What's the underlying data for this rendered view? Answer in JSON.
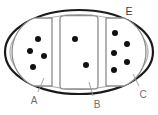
{
  "diagram": {
    "type": "labeled-cross-section",
    "title": "",
    "background_color": "#ffffff",
    "outline": {
      "shape": "ellipse",
      "outer_stroke_color": "#1a1a1a",
      "outer_stroke_width": 2.2,
      "inner_stroke_color": "#b0b0b0",
      "inner_stroke_width": 1.2,
      "center_x": 79,
      "center_y": 52,
      "radius_x": 74,
      "radius_y": 42
    },
    "compartments": [
      {
        "id": "left",
        "label": "A",
        "dot_count": 5,
        "dots": [
          {
            "cx": 38,
            "cy": 39,
            "r": 3.0
          },
          {
            "cx": 31,
            "cy": 51,
            "r": 3.0
          },
          {
            "cx": 45,
            "cy": 56,
            "r": 3.0
          },
          {
            "cx": 33,
            "cy": 66,
            "r": 3.0
          },
          {
            "cx": 24,
            "cy": 52,
            "r": 0
          }
        ],
        "fill": "#ffffff",
        "stroke": "#8c8c8c"
      },
      {
        "id": "middle",
        "label": "B",
        "dot_count": 2,
        "dots": [
          {
            "cx": 75,
            "cy": 39,
            "r": 3.0
          },
          {
            "cx": 86,
            "cy": 65,
            "r": 3.0
          }
        ],
        "fill": "#ffffff",
        "stroke": "#8c8c8c"
      },
      {
        "id": "right",
        "label": "C",
        "dot_count": 6,
        "dots": [
          {
            "cx": 115,
            "cy": 33,
            "r": 3.0
          },
          {
            "cx": 126,
            "cy": 43,
            "r": 3.0
          },
          {
            "cx": 114,
            "cy": 53,
            "r": 3.0
          },
          {
            "cx": 126,
            "cy": 61,
            "r": 3.0
          },
          {
            "cx": 114,
            "cy": 70,
            "r": 3.0
          },
          {
            "cx": 103,
            "cy": 52,
            "r": 0
          }
        ],
        "fill": "#ffffff",
        "stroke": "#8c8c8c"
      }
    ],
    "dot_color": "#111111",
    "labels": [
      {
        "id": "label-e",
        "text": "E",
        "x": 129,
        "y": 12,
        "position": "top-right",
        "target": "outer-membrane",
        "has_leader": false
      },
      {
        "id": "label-a",
        "text": "A",
        "x": 33,
        "y": 100,
        "position": "bottom-left",
        "target": "left-compartment",
        "has_leader": true,
        "leader": {
          "x1": 38,
          "y1": 91,
          "x2": 44,
          "y2": 78
        }
      },
      {
        "id": "label-b",
        "text": "B",
        "x": 96,
        "y": 104,
        "position": "bottom-center",
        "target": "middle-compartment",
        "has_leader": true,
        "leader": {
          "x1": 93,
          "y1": 95,
          "x2": 89,
          "y2": 82
        }
      },
      {
        "id": "label-c",
        "text": "C",
        "x": 142,
        "y": 94,
        "position": "bottom-right",
        "target": "right-compartment",
        "has_leader": true,
        "leader": {
          "x1": 138,
          "y1": 86,
          "x2": 133,
          "y2": 75
        }
      }
    ],
    "leader_line_color": "#9a9a9a",
    "leader_line_width": 0.9
  }
}
